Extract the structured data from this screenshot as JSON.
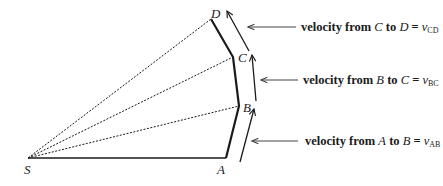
{
  "diagram": {
    "points": {
      "S": {
        "label": "S",
        "x": 28,
        "y": 158
      },
      "A": {
        "label": "A",
        "x": 226,
        "y": 158
      },
      "B": {
        "label": "B",
        "x": 239,
        "y": 106
      },
      "C": {
        "label": "C",
        "x": 233,
        "y": 57
      },
      "D": {
        "label": "D",
        "x": 211,
        "y": 19
      }
    },
    "labels": {
      "cd": {
        "prefix": "velocity from ",
        "from": "C",
        "mid": " to ",
        "to": "D",
        "eq": " = ",
        "v": "v",
        "sub": "CD"
      },
      "bc": {
        "prefix": "velocity from ",
        "from": "B",
        "mid": " to ",
        "to": "C",
        "eq": " = ",
        "v": "v",
        "sub": "BC"
      },
      "ab": {
        "prefix": "velocity from ",
        "from": "A",
        "mid": " to ",
        "to": "B",
        "eq": " = ",
        "v": "v",
        "sub": "AB"
      }
    },
    "colors": {
      "ink": "#1a1a1a",
      "pointer": "#555555"
    }
  }
}
